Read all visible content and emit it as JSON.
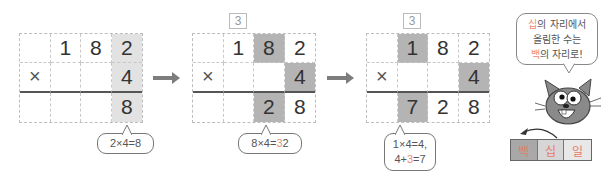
{
  "colors": {
    "highlight_light": "#e2e2e2",
    "highlight_dark": "#b4b4b4",
    "accent_salmon": "#f08a78",
    "text": "#333333",
    "arrow": "#7d7d7d"
  },
  "steps": [
    {
      "carry": "",
      "rows": [
        [
          "",
          "1",
          "8",
          "2"
        ],
        [
          "×",
          "",
          "",
          "4"
        ],
        [
          "",
          "",
          "",
          "8"
        ]
      ],
      "bubble": {
        "parts": [
          "2×4=8"
        ]
      }
    },
    {
      "carry": "3",
      "rows": [
        [
          "",
          "1",
          "8",
          "2"
        ],
        [
          "×",
          "",
          "",
          "4"
        ],
        [
          "",
          "",
          "2",
          "8"
        ]
      ],
      "bubble": {
        "parts": [
          "8×4=",
          "3",
          "2"
        ]
      }
    },
    {
      "carry": "3",
      "rows": [
        [
          "",
          "1",
          "8",
          "2"
        ],
        [
          "×",
          "",
          "",
          "4"
        ],
        [
          "",
          "7",
          "2",
          "8"
        ]
      ],
      "bubble": {
        "line1": "1×4=4,",
        "line2_a": "4+",
        "line2_b": "3",
        "line2_c": "=7"
      }
    }
  ],
  "speech": {
    "line1_a": "십",
    "line1_b": "의 자리에서",
    "line2": "올림한 수는",
    "line3_a": "백",
    "line3_b": "의 자리로!"
  },
  "place_values": [
    "백",
    "십",
    "일"
  ],
  "place_value_colors": [
    "#a8a8a8",
    "#d6d6d6",
    "#e8e8e8"
  ]
}
